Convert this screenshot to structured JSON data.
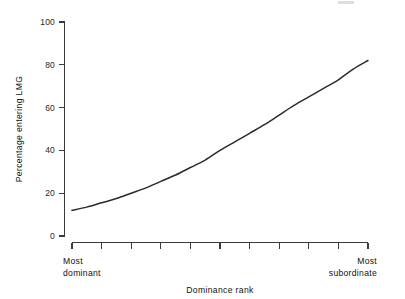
{
  "figure": {
    "background_color": "#ffffff",
    "line_color": "#2b2b2b",
    "axis_color": "#3a3a3a"
  },
  "chart_data": {
    "type": "line",
    "title": "",
    "xlabel": "Dominance rank",
    "ylabel": "Percentage entering LMG",
    "ylim": [
      0,
      100
    ],
    "yticks": [
      0,
      20,
      40,
      60,
      80,
      100
    ],
    "ytick_labels": [
      "0",
      "20",
      "40",
      "60",
      "80",
      "100"
    ],
    "xlim": [
      0,
      10
    ],
    "xticks": [
      0,
      1,
      2,
      3,
      4,
      5,
      6,
      7,
      8,
      9,
      10
    ],
    "xtick_labels": [
      "",
      "",
      "",
      "",
      "",
      "",
      "",
      "",
      "",
      "",
      ""
    ],
    "x_axis_end_labels": {
      "left_line1": "Most",
      "left_line2": "dominant",
      "right_line1": "Most",
      "right_line2": "subordinate"
    },
    "grid": false,
    "legend": false,
    "series": [
      {
        "name": "Percentage entering LMG",
        "x": [
          0,
          0.5,
          1,
          1.5,
          2,
          2.5,
          3,
          3.5,
          4,
          4.5,
          5,
          5.5,
          6,
          6.5,
          7,
          7.5,
          8,
          8.5,
          9,
          9.5,
          10
        ],
        "values": [
          12,
          13.5,
          15.5,
          17.5,
          20,
          22.5,
          25.5,
          28.5,
          32,
          35.5,
          40,
          44,
          48,
          52,
          56.5,
          61,
          65,
          69,
          73,
          78,
          82
        ]
      }
    ]
  },
  "axis_titles": {
    "x": "Dominance rank",
    "y": "Percentage entering LMG"
  }
}
